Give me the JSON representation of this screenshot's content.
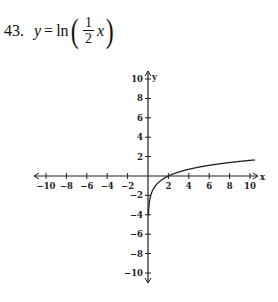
{
  "problem": {
    "number": "43.",
    "lhs": "y",
    "equals": "=",
    "func": "ln",
    "frac_num": "1",
    "frac_den": "2",
    "arg": "x"
  },
  "chart_data": {
    "type": "line",
    "xlabel": "x",
    "ylabel": "y",
    "xlim": [
      -10,
      10
    ],
    "ylim": [
      -10,
      10
    ],
    "x_ticks": [
      -10,
      -8,
      -6,
      -4,
      -2,
      2,
      4,
      6,
      8,
      10
    ],
    "y_ticks": [
      -10,
      -8,
      -6,
      -4,
      -2,
      2,
      4,
      6,
      8,
      10
    ],
    "grid": false,
    "series": [
      {
        "name": "y = ln(x/2)",
        "x": [
          0.05,
          0.1,
          0.2,
          0.4,
          0.7,
          1,
          1.5,
          2,
          3,
          4,
          5,
          6,
          7,
          8,
          9,
          10.5
        ],
        "y": [
          -3.69,
          -3.0,
          -2.3,
          -1.61,
          -1.05,
          -0.69,
          -0.29,
          0,
          0.41,
          0.69,
          0.92,
          1.1,
          1.25,
          1.39,
          1.5,
          1.66
        ]
      }
    ],
    "x_tick_labels": [
      "-10",
      "-8",
      "-6",
      "-4",
      "-2",
      "2",
      "4",
      "6",
      "8",
      "10"
    ],
    "y_tick_labels": [
      "10",
      "8",
      "6",
      "4",
      "2",
      "-2",
      "-4",
      "-6",
      "-8",
      "-10"
    ]
  }
}
